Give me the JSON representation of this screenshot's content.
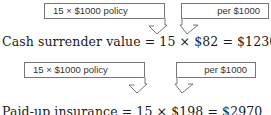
{
  "block1": {
    "callout_left": "15 × $1000 policy",
    "callout_right": "per $1000",
    "equation": "Cash surrender value = 15 × $82 = $1230"
  },
  "block2": {
    "callout_left": "15 × $1000 policy",
    "callout_right": "per $1000",
    "equation": "Paid-up insurance = 15 × $198 = $2970"
  }
}
